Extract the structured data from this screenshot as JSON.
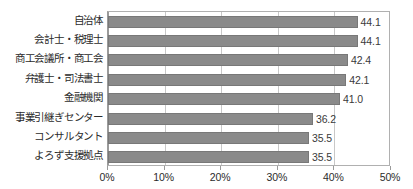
{
  "chart_data": {
    "type": "bar",
    "orientation": "horizontal",
    "title": "",
    "subtitle": "",
    "xlabel": "",
    "ylabel": "",
    "xlim": [
      0,
      50
    ],
    "grid": true,
    "legend": "none",
    "tick_labels": [
      "0%",
      "10%",
      "20%",
      "30%",
      "40%",
      "50%"
    ],
    "tick_values": [
      0,
      10,
      20,
      30,
      40,
      50
    ],
    "categories": [
      "自治体",
      "会計士・税理士",
      "商工会議所・商工会",
      "弁護士・司法書士",
      "金融機関",
      "事業引継ぎセンター",
      "コンサルタント",
      "よろず支援拠点"
    ],
    "values": [
      44.1,
      44.1,
      42.4,
      42.1,
      41.0,
      36.2,
      35.5,
      35.5
    ],
    "value_labels": [
      "44.1",
      "44.1",
      "42.4",
      "42.1",
      "41.0",
      "36.2",
      "35.5",
      "35.5"
    ],
    "colors": {
      "bar_fill": "#8a8a8a",
      "bar_stroke": "#787878",
      "gridline": "#c8c8c8",
      "axis": "#9a9a9a",
      "plot_border": "#b0b0b0",
      "text": "#2b2b2b",
      "background": "#ffffff"
    }
  }
}
